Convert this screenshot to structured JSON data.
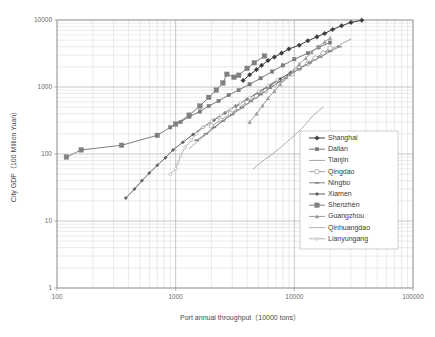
{
  "chart_data": {
    "type": "line",
    "title": "",
    "xlabel": "Port annual throughput（10000 tons）",
    "ylabel": "City GDP（100 Million Yuan）",
    "xscale": "log",
    "yscale": "log",
    "xlim": [
      100,
      100000
    ],
    "ylim": [
      1,
      10000
    ],
    "xticks": [
      "100",
      "1000",
      "10000",
      "100000"
    ],
    "yticks": [
      "1",
      "10",
      "100",
      "1000",
      "10000"
    ],
    "grid": true,
    "legend_position": "bottom-right",
    "series": [
      {
        "name": "Shanghai",
        "marker": "filled-diamond",
        "color": "#3b3b3b",
        "points": [
          [
            3700,
            1250
          ],
          [
            4200,
            1520
          ],
          [
            4800,
            1820
          ],
          [
            5300,
            2100
          ],
          [
            6000,
            2480
          ],
          [
            6800,
            2800
          ],
          [
            7800,
            3200
          ],
          [
            9000,
            3700
          ],
          [
            11000,
            4200
          ],
          [
            13000,
            4900
          ],
          [
            15500,
            5600
          ],
          [
            18000,
            6300
          ],
          [
            21000,
            7200
          ],
          [
            25000,
            8200
          ],
          [
            30000,
            9200
          ],
          [
            37000,
            9900
          ]
        ]
      },
      {
        "name": "Dalian",
        "marker": "small-square",
        "color": "#7a7a7a",
        "points": [
          [
            900,
            250
          ],
          [
            1100,
            300
          ],
          [
            1300,
            360
          ],
          [
            1600,
            430
          ],
          [
            1900,
            520
          ],
          [
            2300,
            620
          ],
          [
            2800,
            760
          ],
          [
            3400,
            900
          ],
          [
            4200,
            1100
          ],
          [
            5200,
            1350
          ],
          [
            6500,
            1700
          ],
          [
            8000,
            2100
          ],
          [
            10000,
            2600
          ],
          [
            13000,
            3200
          ],
          [
            16000,
            3900
          ],
          [
            20000,
            4600
          ]
        ]
      },
      {
        "name": "Tianjin",
        "marker": "none",
        "color": "#8d8d8d",
        "points": [
          [
            1300,
            120
          ],
          [
            1500,
            150
          ],
          [
            1700,
            180
          ],
          [
            1900,
            210
          ],
          [
            2200,
            260
          ],
          [
            2600,
            330
          ],
          [
            3100,
            420
          ],
          [
            3800,
            530
          ],
          [
            4600,
            680
          ],
          [
            5600,
            860
          ],
          [
            6900,
            1100
          ],
          [
            8500,
            1400
          ],
          [
            10500,
            1800
          ],
          [
            13000,
            2300
          ],
          [
            16000,
            2900
          ],
          [
            20000,
            3600
          ],
          [
            25000,
            4400
          ],
          [
            30000,
            5200
          ]
        ]
      },
      {
        "name": "Qingdao",
        "marker": "open-circle",
        "color": "#a0a0a0",
        "points": [
          [
            2000,
            260
          ],
          [
            2400,
            320
          ],
          [
            2900,
            400
          ],
          [
            3400,
            490
          ],
          [
            4000,
            600
          ],
          [
            4800,
            730
          ],
          [
            5700,
            890
          ],
          [
            6800,
            1080
          ],
          [
            8000,
            1300
          ],
          [
            9500,
            1570
          ],
          [
            11000,
            1880
          ],
          [
            13000,
            2250
          ],
          [
            15000,
            2700
          ],
          [
            17500,
            3200
          ],
          [
            20000,
            3800
          ]
        ]
      },
      {
        "name": "Ningbo",
        "marker": "dash",
        "color": "#868686",
        "points": [
          [
            1500,
            160
          ],
          [
            1800,
            200
          ],
          [
            2100,
            250
          ],
          [
            2500,
            310
          ],
          [
            3000,
            390
          ],
          [
            3600,
            490
          ],
          [
            4300,
            610
          ],
          [
            5200,
            770
          ],
          [
            6200,
            960
          ],
          [
            7500,
            1200
          ],
          [
            9000,
            1500
          ],
          [
            11000,
            1870
          ],
          [
            13500,
            2300
          ],
          [
            16500,
            2800
          ],
          [
            20000,
            3400
          ],
          [
            24000,
            4000
          ]
        ]
      },
      {
        "name": "Xiamen",
        "marker": "filled-diamond-small",
        "color": "#5d5d5d",
        "points": [
          [
            380,
            22
          ],
          [
            450,
            30
          ],
          [
            520,
            40
          ],
          [
            600,
            52
          ],
          [
            700,
            68
          ],
          [
            820,
            88
          ],
          [
            950,
            115
          ],
          [
            1150,
            150
          ],
          [
            1400,
            195
          ],
          [
            1700,
            250
          ],
          [
            2100,
            320
          ],
          [
            2600,
            410
          ],
          [
            3200,
            520
          ],
          [
            4000,
            660
          ],
          [
            5000,
            830
          ],
          [
            6200,
            1050
          ],
          [
            7600,
            1320
          ],
          [
            9300,
            1650
          ]
        ]
      },
      {
        "name": "Shenzhen",
        "marker": "square",
        "color": "#808080",
        "points": [
          [
            120,
            90
          ],
          [
            160,
            115
          ],
          [
            350,
            135
          ],
          [
            700,
            190
          ],
          [
            1000,
            280
          ],
          [
            1300,
            380
          ],
          [
            1600,
            520
          ],
          [
            1900,
            700
          ],
          [
            2200,
            900
          ],
          [
            2500,
            1150
          ],
          [
            2700,
            1550
          ],
          [
            3100,
            1400
          ],
          [
            3400,
            1500
          ],
          [
            4000,
            1900
          ],
          [
            4600,
            2300
          ],
          [
            5600,
            2900
          ]
        ]
      },
      {
        "name": "Guangzhou",
        "marker": "small-triangle",
        "color": "#9b9b9b",
        "points": [
          [
            4200,
            300
          ],
          [
            4800,
            400
          ],
          [
            5400,
            530
          ],
          [
            6000,
            680
          ],
          [
            6800,
            870
          ],
          [
            7600,
            1100
          ],
          [
            8600,
            1400
          ],
          [
            9800,
            1750
          ],
          [
            11000,
            2200
          ],
          [
            12500,
            2700
          ],
          [
            14000,
            3300
          ],
          [
            16000,
            4000
          ],
          [
            18000,
            4700
          ],
          [
            20000,
            5400
          ]
        ]
      },
      {
        "name": "Qinhuangdao",
        "marker": "none",
        "color": "#9a9a9a",
        "points": [
          [
            4500,
            60
          ],
          [
            5000,
            70
          ],
          [
            5600,
            82
          ],
          [
            6300,
            95
          ],
          [
            7000,
            110
          ],
          [
            7800,
            128
          ],
          [
            8600,
            150
          ],
          [
            9500,
            175
          ],
          [
            10500,
            205
          ],
          [
            11500,
            240
          ],
          [
            12500,
            280
          ],
          [
            13500,
            330
          ],
          [
            14500,
            380
          ],
          [
            16000,
            440
          ],
          [
            17500,
            500
          ]
        ]
      },
      {
        "name": "Lianyungang",
        "marker": "open-dash",
        "color": "#b0b0b0",
        "points": [
          [
            900,
            50
          ],
          [
            1000,
            60
          ],
          [
            1050,
            75
          ],
          [
            1100,
            95
          ],
          [
            1200,
            125
          ],
          [
            1350,
            160
          ],
          [
            1500,
            200
          ],
          [
            1700,
            250
          ],
          [
            2000,
            310
          ],
          [
            2400,
            380
          ],
          [
            2900,
            470
          ],
          [
            3500,
            580
          ],
          [
            4200,
            700
          ],
          [
            5000,
            860
          ],
          [
            6000,
            1050
          ],
          [
            7200,
            1280
          ]
        ]
      }
    ]
  },
  "axes": {
    "x_tick_labels": [
      "100",
      "1000",
      "10000",
      "100000"
    ],
    "y_tick_labels": [
      "1",
      "10",
      "100",
      "1000",
      "10000"
    ],
    "x_title": "Port annual throughput（10000 tons）",
    "y_title": "City GDP（100 Million Yuan）"
  },
  "legend": {
    "items": [
      {
        "label": "Shanghai"
      },
      {
        "label": "Dalian"
      },
      {
        "label": "Tianjin"
      },
      {
        "label": "Qingdao"
      },
      {
        "label": "Ningbo"
      },
      {
        "label": "Xiamen"
      },
      {
        "label": "Shenzhen"
      },
      {
        "label": "Guangzhou"
      },
      {
        "label": "Qinhuangdao"
      },
      {
        "label": "Lianyungang"
      }
    ]
  }
}
